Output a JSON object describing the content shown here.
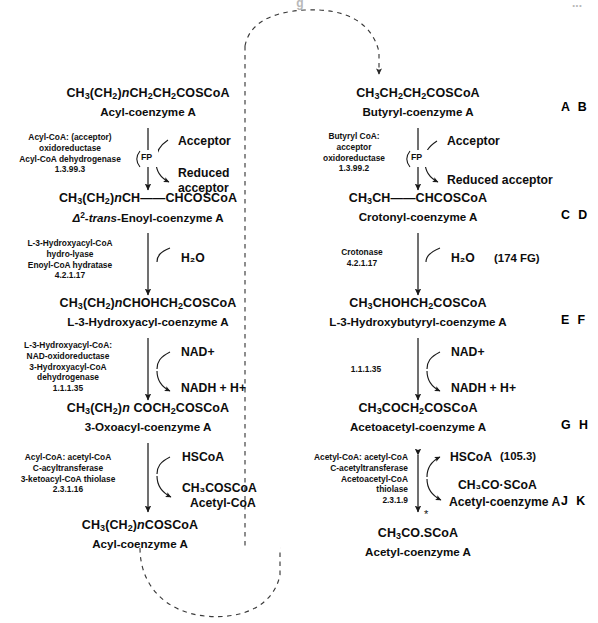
{
  "page": {
    "width": 598,
    "height": 623,
    "cropped_header": "g",
    "cropped_header_right": "..."
  },
  "diagram": {
    "title_semantic": "fatty-acid-beta-oxidation-spiral",
    "left_column_label": "general acyl-CoA pathway",
    "right_column_label": "butyryl-CoA specific pathway"
  },
  "left": {
    "steps": [
      {
        "formula_html": "CH<sub>3</sub>(CH<sub>2</sub>)<span class=\"ital\">n</span>CH<sub>2</sub>CH<sub>2</sub>COSCoA",
        "name_html": "Acyl-coenzyme A",
        "enzyme_lines": [
          "Acyl-CoA: (acceptor)",
          "oxidoreductase",
          "Acyl-CoA dehydrogenase",
          "1.3.99.3"
        ],
        "cofactor_in": "Acceptor",
        "cofactor_out_line1": "Reduced",
        "cofactor_out_line2": "acceptor",
        "carrier": "FP"
      },
      {
        "formula_html": "CH<sub>3</sub>(CH<sub>2</sub>)<span class=\"ital\">n</span>CH&#8212;&#8212;CHCOSCoA",
        "name_html": "<span class=\"ital\">&#916;</span><sup>2</sup>-<span class=\"ital\">trans</span>-Enoyl-coenzyme A",
        "enzyme_lines": [
          "L-3-Hydroxyacyl-CoA",
          "hydro-lyase",
          "Enoyl-CoA hydratase",
          "4.2.1.17"
        ],
        "cofactor_in": "H₂O"
      },
      {
        "formula_html": "CH<sub>3</sub>(CH<sub>2</sub>)<span class=\"ital\">n</span>CHOHCH<sub>2</sub>COSCoA",
        "name_html": "L-3-Hydroxyacyl-coenzyme A",
        "enzyme_lines": [
          "L-3-Hydroxyacyl-CoA:",
          "NAD-oxidoreductase",
          "3-Hydroxyacyl-CoA",
          "dehydrogenase",
          "1.1.1.35"
        ],
        "cofactor_in": "NAD+",
        "cofactor_out": "NADH + H+"
      },
      {
        "formula_html": "CH<sub>3</sub>(CH<sub>2</sub>)<span class=\"ital\">n</span> COCH<sub>2</sub>COSCoA",
        "name_html": "3-Oxoacyl-coenzyme A",
        "enzyme_lines": [
          "Acyl-CoA: acetyl-CoA",
          "C-acyltransferase",
          "3-ketoacyl-CoA thiolase",
          "2.3.1.16"
        ],
        "cofactor_in": "HSCoA",
        "cofactor_out_line1": "CH₃COSCoA",
        "cofactor_out_line2": "Acetyl-CoA"
      },
      {
        "formula_html": "CH<sub>3</sub>(CH<sub>2</sub>)<span class=\"ital\">n</span>COSCoA",
        "name_html": "Acyl-coenzyme A"
      }
    ]
  },
  "right": {
    "steps": [
      {
        "formula_html": "CH<sub>3</sub>CH<sub>2</sub>CH<sub>2</sub>COSCoA",
        "name_html": "Butyryl-coenzyme A",
        "enzyme_lines": [
          "Butyryl CoA:",
          "acceptor",
          "oxidoreductase",
          "1.3.99.2"
        ],
        "cofactor_in": "Acceptor",
        "cofactor_out": "Reduced acceptor",
        "carrier": "FP",
        "margin_letters": "A B"
      },
      {
        "formula_html": "CH<sub>3</sub>CH&#8212;&#8212;CHCOSCoA",
        "name_html": "Crotonyl-coenzyme A",
        "enzyme_lines": [
          "Crotonase",
          "4.2.1.17"
        ],
        "cofactor_in": "H₂O",
        "note": "(174 FG)",
        "margin_letters": "C D"
      },
      {
        "formula_html": "CH<sub>3</sub>CHOHCH<sub>2</sub>COSCoA",
        "name_html": "L-3-Hydroxybutyryl-coenzyme A",
        "enzyme_lines": [
          "1.1.1.35"
        ],
        "cofactor_in": "NAD+",
        "cofactor_out": "NADH + H+",
        "margin_letters": "E F"
      },
      {
        "formula_html": "CH<sub>3</sub>COCH<sub>2</sub>COSCoA",
        "name_html": "Acetoacetyl-coenzyme A",
        "enzyme_lines": [
          "Acetyl-CoA: acetyl-CoA",
          "C-acetyltransferase",
          "Acetoacetyl-CoA",
          "thiolase",
          "2.3.1.9"
        ],
        "cofactor_in": "HSCoA",
        "cofactor_out_line1": "CH₃CO&#183;SCoA",
        "cofactor_out_line2": "Acetyl-coenzyme A",
        "note": "(105.3)",
        "margin_letters_top": "G H",
        "margin_letters_bottom": "J K"
      },
      {
        "formula_html": "CH<sub>3</sub>CO.SCoA",
        "name_html": "Acetyl-coenzyme A"
      }
    ]
  }
}
